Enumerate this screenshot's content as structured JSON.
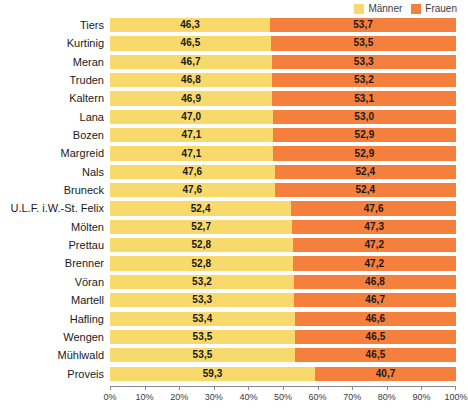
{
  "legend": {
    "entries": [
      {
        "label": "Männer",
        "color": "#f8d96c",
        "icon": "square-swatch-icon"
      },
      {
        "label": "Frauen",
        "color": "#f5803e",
        "icon": "square-swatch-icon"
      }
    ]
  },
  "axis": {
    "ticks": [
      "0%",
      "10%",
      "20%",
      "30%",
      "40%",
      "50%",
      "60%",
      "70%",
      "80%",
      "90%",
      "100%"
    ]
  },
  "colors": {
    "male": "#f8d96c",
    "female": "#f5803e",
    "axis": "#8a8a8a",
    "text": "#1a1a1a",
    "background": "#ffffff"
  },
  "chart_data": {
    "type": "bar",
    "orientation": "horizontal",
    "stacked": true,
    "normalized_percent": true,
    "title": "",
    "subtitle": "",
    "xlabel": "",
    "ylabel": "",
    "xlim": [
      0,
      100
    ],
    "grid": false,
    "legend_position": "top-right",
    "tick_labels": [
      "0%",
      "10%",
      "20%",
      "30%",
      "40%",
      "50%",
      "60%",
      "70%",
      "80%",
      "90%",
      "100%"
    ],
    "categories": [
      "Tiers",
      "Kurtinig",
      "Meran",
      "Truden",
      "Kaltern",
      "Lana",
      "Bozen",
      "Margreid",
      "Nals",
      "Bruneck",
      "U.L.F. i.W.-St. Felix",
      "Mölten",
      "Prettau",
      "Brenner",
      "Vöran",
      "Martell",
      "Hafling",
      "Wengen",
      "Mühlwald",
      "Proveis"
    ],
    "series": [
      {
        "name": "Männer",
        "color": "#f8d96c",
        "values": [
          46.3,
          46.5,
          46.7,
          46.8,
          46.9,
          47.0,
          47.1,
          47.1,
          47.6,
          47.6,
          52.4,
          52.7,
          52.8,
          52.8,
          53.2,
          53.3,
          53.4,
          53.5,
          53.5,
          59.3
        ],
        "labels": [
          "46,3",
          "46,5",
          "46,7",
          "46,8",
          "46,9",
          "47,0",
          "47,1",
          "47,1",
          "47,6",
          "47,6",
          "52,4",
          "52,7",
          "52,8",
          "52,8",
          "53,2",
          "53,3",
          "53,4",
          "53,5",
          "53,5",
          "59,3"
        ]
      },
      {
        "name": "Frauen",
        "color": "#f5803e",
        "values": [
          53.7,
          53.5,
          53.3,
          53.2,
          53.1,
          53.0,
          52.9,
          52.9,
          52.4,
          52.4,
          47.6,
          47.3,
          47.2,
          47.2,
          46.8,
          46.7,
          46.6,
          46.5,
          46.5,
          40.7
        ],
        "labels": [
          "53,7",
          "53,5",
          "53,3",
          "53,2",
          "53,1",
          "53,0",
          "52,9",
          "52,9",
          "52,4",
          "52,4",
          "47,6",
          "47,3",
          "47,2",
          "47,2",
          "46,8",
          "46,7",
          "46,6",
          "46,5",
          "46,5",
          "40,7"
        ]
      }
    ]
  }
}
